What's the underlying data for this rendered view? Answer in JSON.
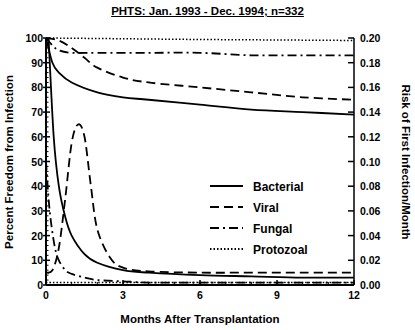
{
  "chart_data": {
    "type": "line",
    "title": "PHTS:  Jan. 1993 - Dec. 1994;  n=332",
    "xlabel": "Months After Transplantation",
    "ylabel": "Percent Freedom from Infection",
    "y2label": "Risk of First Infection/Month",
    "xlim": [
      0,
      12
    ],
    "ylim": [
      0,
      100
    ],
    "y2lim": [
      0,
      0.2
    ],
    "x_ticks": [
      "0",
      "3",
      "6",
      "9",
      "12"
    ],
    "y_ticks": [
      "0",
      "10",
      "20",
      "30",
      "40",
      "50",
      "60",
      "70",
      "80",
      "90",
      "100"
    ],
    "y2_ticks": [
      "0.00",
      "0.02",
      "0.04",
      "0.06",
      "0.08",
      "0.10",
      "0.12",
      "0.14",
      "0.16",
      "0.18",
      "0.20"
    ],
    "grid": false,
    "legend_position": "inside-right",
    "legend": [
      "Bacterial",
      "Viral",
      "Fungal",
      "Protozoal"
    ],
    "series": [
      {
        "name": "Bacterial",
        "kind": "freedom",
        "axis": "left",
        "style": "solid",
        "x": [
          0,
          0.25,
          0.5,
          1,
          2,
          3,
          4,
          6,
          8,
          10,
          12
        ],
        "values": [
          100,
          90,
          86,
          82,
          78,
          76,
          75,
          73,
          71,
          70,
          69
        ]
      },
      {
        "name": "Viral",
        "kind": "freedom",
        "axis": "left",
        "style": "dashed",
        "x": [
          0,
          0.5,
          1,
          1.5,
          2,
          3,
          4,
          6,
          8,
          10,
          12
        ],
        "values": [
          100,
          99,
          96,
          92,
          88,
          84,
          82,
          80,
          78,
          76,
          75
        ]
      },
      {
        "name": "Fungal",
        "kind": "freedom",
        "axis": "left",
        "style": "dash-dot",
        "x": [
          0,
          0.25,
          0.5,
          1,
          2,
          4,
          6,
          8,
          10,
          12
        ],
        "values": [
          100,
          97,
          95,
          94,
          94,
          94,
          94,
          93,
          93,
          93
        ]
      },
      {
        "name": "Protozoal",
        "kind": "freedom",
        "axis": "left",
        "style": "dotted",
        "x": [
          0,
          3,
          6,
          9,
          12
        ],
        "values": [
          100,
          99.7,
          99.4,
          99.2,
          99
        ]
      },
      {
        "name": "Bacterial",
        "kind": "hazard",
        "axis": "right",
        "style": "solid",
        "x": [
          0.1,
          0.3,
          0.5,
          0.75,
          1,
          1.5,
          2,
          3,
          4,
          6,
          8,
          10,
          12
        ],
        "values": [
          0.2,
          0.12,
          0.08,
          0.055,
          0.04,
          0.025,
          0.018,
          0.012,
          0.01,
          0.008,
          0.007,
          0.006,
          0.006
        ]
      },
      {
        "name": "Viral",
        "kind": "hazard",
        "axis": "right",
        "style": "dashed",
        "x": [
          0,
          0.25,
          0.5,
          0.75,
          1,
          1.25,
          1.5,
          1.75,
          2,
          2.5,
          3,
          4,
          6,
          8,
          10,
          12
        ],
        "values": [
          0.01,
          0.012,
          0.03,
          0.07,
          0.115,
          0.13,
          0.12,
          0.08,
          0.045,
          0.022,
          0.014,
          0.011,
          0.01,
          0.01,
          0.01,
          0.01
        ]
      },
      {
        "name": "Fungal",
        "kind": "hazard",
        "axis": "right",
        "style": "dash-dot",
        "x": [
          0,
          0.1,
          0.2,
          0.35,
          0.5,
          0.75,
          1,
          1.5,
          2,
          3,
          4,
          6,
          12
        ],
        "values": [
          0.1,
          0.07,
          0.05,
          0.03,
          0.02,
          0.012,
          0.009,
          0.006,
          0.004,
          0.003,
          0.002,
          0.002,
          0.002
        ]
      },
      {
        "name": "Protozoal",
        "kind": "hazard",
        "axis": "right",
        "style": "dotted",
        "x": [
          0,
          12
        ],
        "values": [
          0.002,
          0.002
        ]
      }
    ]
  }
}
